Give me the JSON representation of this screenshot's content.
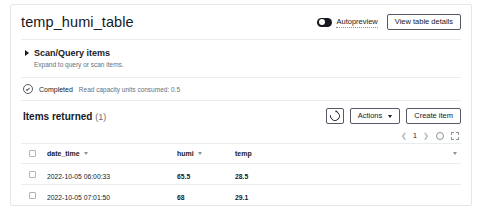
{
  "header": {
    "title": "temp_humi_table",
    "autopreview_label": "Autopreview",
    "autopreview_toggle_icon": "toggle-on-icon",
    "view_table_details_label": "View table details"
  },
  "scan_query": {
    "expand_icon": "caret-right-icon",
    "title": "Scan/Query items",
    "subtitle": "Expand to query or scan items."
  },
  "status": {
    "icon": "check-circle-icon",
    "label": "Completed",
    "detail": "Read capacity units consumed: 0.5"
  },
  "items_toolbar": {
    "title": "Items returned",
    "count": "(1)",
    "refresh_icon": "refresh-icon",
    "actions_label": "Actions",
    "actions_caret_icon": "caret-down-icon",
    "create_item_label": "Create item"
  },
  "pagination": {
    "prev_icon": "chevron-left-icon",
    "page": "1",
    "next_icon": "chevron-right-icon",
    "settings_icon": "gear-icon",
    "fullscreen_icon": "expand-icon"
  },
  "table": {
    "select_all_icon": "checkbox-icon",
    "columns": [
      {
        "label": "date_time",
        "sortable": true
      },
      {
        "label": "humi",
        "sortable": true
      },
      {
        "label": "temp",
        "sortable": false
      }
    ],
    "trailing_sort_icon": "caret-down-icon",
    "rows": [
      {
        "date_time": "2022-10-05 06:00:33",
        "humi": "65.5",
        "temp": "28.5"
      },
      {
        "date_time": "2022-10-05 07:01:50",
        "humi": "68",
        "temp": "29.1"
      }
    ]
  },
  "colors": {
    "border": "#e4e6e8",
    "divider": "#eaeded",
    "text": "#16191f",
    "muted": "#687078",
    "icon_muted": "#879596"
  }
}
